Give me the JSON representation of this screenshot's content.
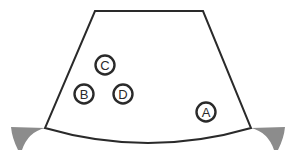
{
  "diagram": {
    "canvas": {
      "width": 294,
      "height": 161,
      "background": "#ffffff"
    },
    "style": {
      "outline_color": "#2a2a2a",
      "outline_width": 2,
      "fill_color": "#ffffff",
      "wedge_fill": "#8c8c8c",
      "marker_stroke_color": "#2a2a2a",
      "marker_stroke_width": 2.4,
      "marker_radius": 9.5,
      "label_color": "#2a2a2a",
      "label_font_size": 13
    },
    "body": {
      "name": "trapezoid-body",
      "top_left": [
        95,
        11
      ],
      "top_right": [
        203,
        11
      ],
      "bottom_left": [
        45,
        128
      ],
      "bottom_right": [
        251,
        128
      ],
      "bottom_arc_sag": 24,
      "path": "M 95 11 L 203 11 L 251 128 Q 148 158 45 128 Z"
    },
    "wedges": [
      {
        "name": "wedge-left",
        "side": "left",
        "path": "M 11 127 L 45 128 Q 28 132 22 150 L 18 150 Q 12 138 11 127 Z"
      },
      {
        "name": "wedge-right",
        "side": "right",
        "path": "M 285 127 L 251 128 Q 268 132 274 150 L 278 150 Q 284 138 285 127 Z"
      }
    ],
    "markers": [
      {
        "id": "marker-c",
        "label": "C",
        "cx": 105,
        "cy": 65
      },
      {
        "id": "marker-b",
        "label": "B",
        "cx": 84,
        "cy": 94
      },
      {
        "id": "marker-d",
        "label": "D",
        "cx": 123,
        "cy": 94
      },
      {
        "id": "marker-a",
        "label": "A",
        "cx": 206,
        "cy": 112
      }
    ]
  }
}
